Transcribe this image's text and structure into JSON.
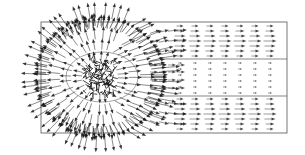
{
  "chart_data": {
    "type": "quiver",
    "title": "",
    "xlabel": "",
    "ylabel": "",
    "grid": false,
    "legend": null,
    "domain": {
      "frame_px": {
        "x0": 41,
        "y0": 22,
        "x1": 287,
        "y1": 133
      },
      "band_lines_y_px": [
        59,
        96
      ],
      "band_lines_x_start_px": 160
    },
    "source": {
      "center_px": [
        100,
        77
      ],
      "outer_radius_px": 62,
      "inner_contour": {
        "cx": 102,
        "cy": 77,
        "rx": 36,
        "ry": 25
      }
    },
    "downstream_field": {
      "direction": "right",
      "columns_x_px": [
        180,
        195,
        210,
        225,
        240,
        255,
        270
      ],
      "upper_band_rows_y_px": [
        26,
        31,
        36,
        41,
        46,
        51,
        56
      ],
      "middle_band_rows_y_px": [
        63,
        69,
        75,
        81,
        87,
        93
      ],
      "lower_band_rows_y_px": [
        99,
        104,
        109,
        114,
        119,
        124,
        129
      ],
      "relative_magnitude": {
        "upper": 1.0,
        "middle": 0.25,
        "lower": 1.0
      }
    },
    "colors": {
      "arrows": "#1a1a1a",
      "frame": "#555555",
      "background": "#ffffff"
    }
  }
}
